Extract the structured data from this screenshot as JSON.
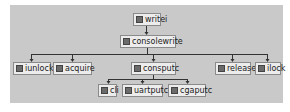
{
  "diagram": {
    "type": "call-tree",
    "nodes": [
      {
        "id": "writei",
        "label": "writei",
        "icon": "function-icon"
      },
      {
        "id": "consolewrite",
        "label": "consolewrite",
        "icon": "function-icon"
      },
      {
        "id": "iunlock",
        "label": "iunlock",
        "icon": "function-icon"
      },
      {
        "id": "acquire",
        "label": "acquire",
        "icon": "function-icon"
      },
      {
        "id": "consputc",
        "label": "consputc",
        "icon": "function-icon"
      },
      {
        "id": "release",
        "label": "release",
        "icon": "function-icon"
      },
      {
        "id": "ilock",
        "label": "ilock",
        "icon": "function-icon"
      },
      {
        "id": "cli",
        "label": "cli",
        "icon": "function-icon"
      },
      {
        "id": "uartputc",
        "label": "uartputc",
        "icon": "function-icon"
      },
      {
        "id": "cgaputc",
        "label": "cgaputc",
        "icon": "function-icon"
      }
    ],
    "edges": [
      [
        "writei",
        "consolewrite"
      ],
      [
        "consolewrite",
        "iunlock"
      ],
      [
        "consolewrite",
        "acquire"
      ],
      [
        "consolewrite",
        "consputc"
      ],
      [
        "consolewrite",
        "release"
      ],
      [
        "consolewrite",
        "ilock"
      ],
      [
        "consputc",
        "cli"
      ],
      [
        "consputc",
        "uartputc"
      ],
      [
        "consputc",
        "cgaputc"
      ]
    ],
    "colors": {
      "background": "#c9c9c9",
      "node_fill": "#ececec",
      "line": "#333333"
    }
  }
}
